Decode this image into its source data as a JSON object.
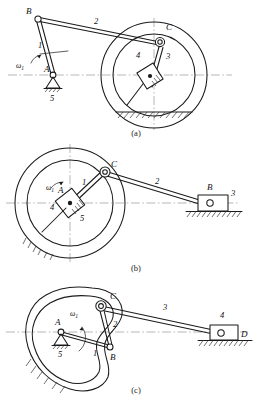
{
  "sheet": {
    "title": "Planar linkage mechanism schematics",
    "background": "#ffffff",
    "line_color": "#1a1a1a",
    "centerline_color": "#9a9a9a"
  },
  "figures": [
    {
      "id": "a",
      "caption": "(a)",
      "description": "Crank-and-rocking-ring mechanism: crank 1 pivots at ground A, coupler 2 connects B to C on a ring, slider block 3 rides on rod inside ring 4, frame 5.",
      "labels": {
        "point_b": "B",
        "point_a": "A",
        "point_c": "C",
        "link_1": "1",
        "link_2": "2",
        "link_3": "3",
        "link_4": "4",
        "link_5": "5",
        "omega": "ω",
        "omega_sub": "1"
      }
    },
    {
      "id": "b",
      "caption": "(b)",
      "description": "Ring with central slider block: crank 1 from centre A to pin C on the ring, coupler 2 to slider B on ground, slider block 4 and frame 5 at centre, output slider 3.",
      "labels": {
        "point_c": "C",
        "point_a": "A",
        "point_b": "B",
        "link_1": "1",
        "link_2": "2",
        "link_3": "3",
        "link_4": "4",
        "link_5": "5",
        "omega": "ω",
        "omega_sub": "1"
      }
    },
    {
      "id": "c",
      "caption": "(c)",
      "description": "Cam-contour mechanism: crank 1 at ground pivot A drives B, link 2 rises to C on the cam contour, long link 3 drives slider 4 at D, frame 5.",
      "labels": {
        "point_a": "A",
        "point_b": "B",
        "point_c": "C",
        "point_d": "D",
        "link_1": "1",
        "link_2": "2",
        "link_3": "3",
        "link_4": "4",
        "link_5": "5",
        "omega": "ω",
        "omega_sub": "1"
      }
    }
  ]
}
